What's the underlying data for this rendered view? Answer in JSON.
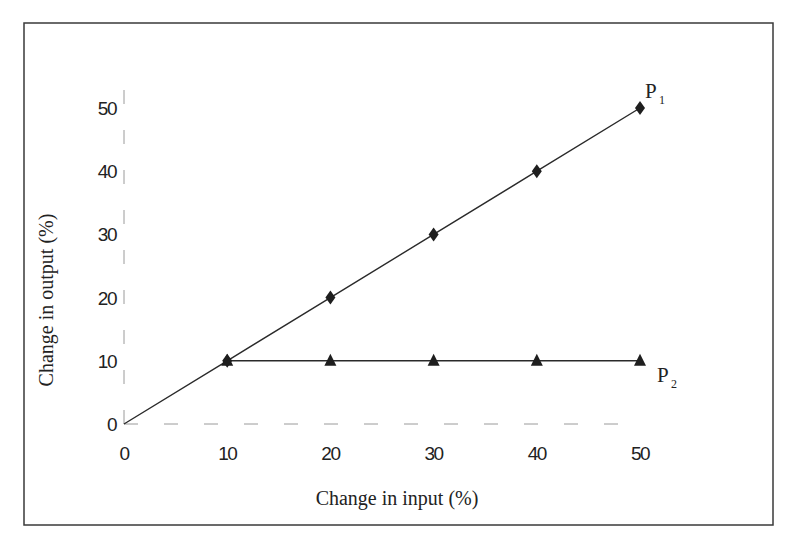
{
  "chart_data": {
    "type": "line",
    "title": "",
    "xlabel": "Change in input (%)",
    "ylabel": "Change in output (%)",
    "xlim": [
      0,
      50
    ],
    "ylim": [
      0,
      50
    ],
    "x_ticks": [
      "0",
      "10",
      "20",
      "30",
      "40",
      "50"
    ],
    "y_ticks": [
      "0",
      "10",
      "20",
      "30",
      "40",
      "50"
    ],
    "grid": false,
    "legend": "inline labels at line ends",
    "series": [
      {
        "name": "P1",
        "label_main": "P",
        "label_sub": "1",
        "marker": "diamond",
        "x": [
          0,
          10,
          20,
          30,
          40,
          50
        ],
        "values": [
          0,
          10,
          20,
          30,
          40,
          50
        ],
        "marked_x": [
          10,
          20,
          30,
          40,
          50
        ]
      },
      {
        "name": "P2",
        "label_main": "P",
        "label_sub": "2",
        "marker": "triangle",
        "x": [
          10,
          20,
          30,
          40,
          50
        ],
        "values": [
          10,
          10,
          10,
          10,
          10
        ],
        "marked_x": [
          10,
          20,
          30,
          40,
          50
        ]
      }
    ]
  },
  "colors": {
    "line": "#2a2a2a",
    "marker": "#1e1e1e",
    "axis": "#9a9a9a",
    "frame": "#3a3a3a",
    "background": "#ffffff"
  }
}
